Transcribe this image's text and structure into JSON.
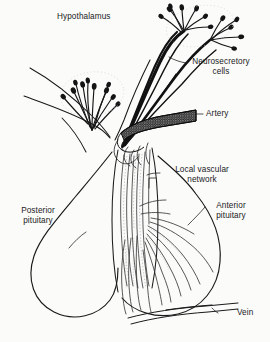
{
  "figure": {
    "background_color": "#fbfbfa",
    "ink_color": "#1a1a1a"
  },
  "labels": {
    "hypothalamus": "Hypothalamus",
    "neurosecretory_cells_line1": "Neurosecretory",
    "neurosecretory_cells_line2": "cells",
    "artery": "Artery",
    "local_vascular_line1": "Local vascular",
    "local_vascular_line2": "network",
    "posterior_pituitary_line1": "Posterior",
    "posterior_pituitary_line2": "pituitary",
    "anterior_pituitary_line1": "Anterior",
    "anterior_pituitary_line2": "pituitary",
    "vein": "Vein"
  },
  "structures": {
    "hypothalamus_outline": "hypothalamus-outline",
    "left_neuron_tuft": "left-neuron-tuft",
    "right_neuron_tuft": "right-neuron-tuft",
    "neuron_axon_bundle": "neuron-axon-bundle",
    "artery_vessel": "artery-vessel",
    "primary_capillary_plexus": "primary-capillary-plexus",
    "pituitary_stalk": "pituitary-stalk",
    "portal_vessels": "portal-vessels",
    "posterior_lobe": "posterior-pituitary-lobe",
    "anterior_lobe": "anterior-pituitary-lobe",
    "secondary_capillary_plexus": "secondary-capillary-plexus",
    "vein_vessel": "vein-vessel"
  }
}
